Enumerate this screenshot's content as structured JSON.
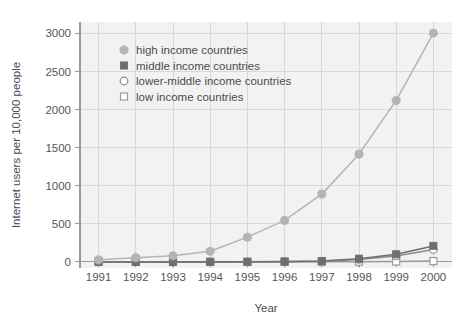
{
  "chart_data": {
    "type": "line",
    "title": "",
    "xlabel": "Year",
    "ylabel": "Internet users per 10,000 people",
    "x": [
      1991,
      1992,
      1993,
      1994,
      1995,
      1996,
      1997,
      1998,
      1999,
      2000
    ],
    "categories": [
      "1991",
      "1992",
      "1993",
      "1994",
      "1995",
      "1996",
      "1997",
      "1998",
      "1999",
      "2000"
    ],
    "xlim": [
      1990.5,
      2000.5
    ],
    "ylim": [
      -80,
      3150
    ],
    "yticks": [
      0,
      500,
      1000,
      1500,
      2000,
      2500,
      3000
    ],
    "ytick_labels": [
      "0",
      "500",
      "1000",
      "1500",
      "2000",
      "2500",
      "3000"
    ],
    "grid": true,
    "legend_position": "upper-left-inside",
    "series": [
      {
        "name": "high income countries",
        "marker": "filled-circle",
        "color": "#b4b4b4",
        "values": [
          27,
          55,
          80,
          140,
          325,
          545,
          890,
          1415,
          2120,
          3005
        ]
      },
      {
        "name": "middle income countries",
        "marker": "filled-square",
        "color": "#6e6e72",
        "values": [
          0,
          0,
          0,
          1,
          2,
          5,
          12,
          42,
          100,
          210
        ]
      },
      {
        "name": "lower-middle income countries",
        "marker": "open-circle",
        "color": "#8c8c90",
        "values": [
          0,
          0,
          0,
          0,
          1,
          3,
          8,
          33,
          78,
          163
        ]
      },
      {
        "name": "low income countries",
        "marker": "open-square",
        "color": "#9a9a9e",
        "values": [
          0,
          0,
          0,
          0,
          0,
          0,
          1,
          2,
          5,
          11
        ]
      }
    ]
  },
  "axis": {
    "x_title": "Year",
    "y_title": "Internet users per 10,000 people",
    "x_tick_labels": [
      "1991",
      "1992",
      "1993",
      "1994",
      "1995",
      "1996",
      "1997",
      "1998",
      "1999",
      "2000"
    ],
    "y_tick_labels": [
      "3000",
      "2500",
      "2000",
      "1500",
      "1000",
      "500",
      "0"
    ]
  },
  "legend": {
    "items": [
      {
        "label": "high income countries",
        "marker": "filled-circle-icon"
      },
      {
        "label": "middle income countries",
        "marker": "filled-square-icon"
      },
      {
        "label": "lower-middle income countries",
        "marker": "open-circle-icon"
      },
      {
        "label": "low income countries",
        "marker": "open-square-icon"
      }
    ]
  },
  "colors": {
    "plot_background": "#f2f2f2",
    "grid": "#d8d8d8",
    "axis": "#9a9a9a",
    "high_income": "#b4b4b4",
    "middle_income": "#6e6e72",
    "lower_middle_income": "#8c8c90",
    "low_income": "#9a9a9e",
    "text": "#4c4c51"
  }
}
